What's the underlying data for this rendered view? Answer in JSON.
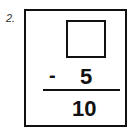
{
  "problem": {
    "number": "2.",
    "minuend": "",
    "operator": "-",
    "subtrahend": "5",
    "difference": "10"
  }
}
